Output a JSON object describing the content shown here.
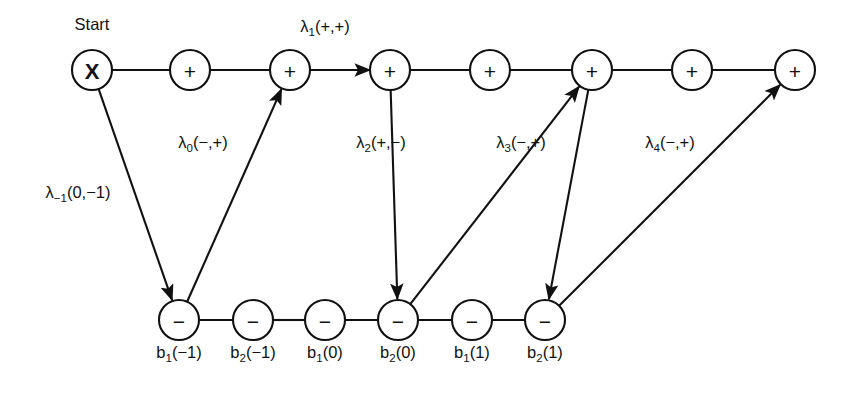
{
  "figure": {
    "background_color": "#ffffff",
    "stroke_color": "#111111",
    "start_label": "Start"
  },
  "top_row": {
    "y": 70,
    "radius": 20,
    "nodes": [
      {
        "id": "t0",
        "x": 92,
        "glyph": "X",
        "glyph_name": "x-glyph"
      },
      {
        "id": "t1",
        "x": 190,
        "glyph": "+",
        "glyph_name": "plus-glyph"
      },
      {
        "id": "t2",
        "x": 290,
        "glyph": "+",
        "glyph_name": "plus-glyph"
      },
      {
        "id": "t3",
        "x": 390,
        "glyph": "+",
        "glyph_name": "plus-glyph"
      },
      {
        "id": "t4",
        "x": 490,
        "glyph": "+",
        "glyph_name": "plus-glyph"
      },
      {
        "id": "t5",
        "x": 592,
        "glyph": "+",
        "glyph_name": "plus-glyph"
      },
      {
        "id": "t6",
        "x": 692,
        "glyph": "+",
        "glyph_name": "plus-glyph"
      },
      {
        "id": "t7",
        "x": 795,
        "glyph": "+",
        "glyph_name": "plus-glyph"
      }
    ]
  },
  "bottom_row": {
    "y": 320,
    "radius": 20,
    "label_y": 358,
    "nodes": [
      {
        "id": "b0",
        "x": 179,
        "glyph": "−",
        "glyph_name": "minus-glyph",
        "label_base": "b",
        "label_sub": "1",
        "label_arg": "(−1)"
      },
      {
        "id": "b1",
        "x": 253,
        "glyph": "−",
        "glyph_name": "minus-glyph",
        "label_base": "b",
        "label_sub": "2",
        "label_arg": "(−1)"
      },
      {
        "id": "b2",
        "x": 325,
        "glyph": "−",
        "glyph_name": "minus-glyph",
        "label_base": "b",
        "label_sub": "1",
        "label_arg": "(0)"
      },
      {
        "id": "b3",
        "x": 398,
        "glyph": "−",
        "glyph_name": "minus-glyph",
        "label_base": "b",
        "label_sub": "2",
        "label_arg": "(0)"
      },
      {
        "id": "b4",
        "x": 472,
        "glyph": "−",
        "glyph_name": "minus-glyph",
        "label_base": "b",
        "label_sub": "1",
        "label_arg": "(1)"
      },
      {
        "id": "b5",
        "x": 545,
        "glyph": "−",
        "glyph_name": "minus-glyph",
        "label_base": "b",
        "label_sub": "2",
        "label_arg": "(1)"
      }
    ]
  },
  "top_chain_edges": [
    {
      "from": "t0",
      "to": "t1",
      "arrow": false
    },
    {
      "from": "t1",
      "to": "t2",
      "arrow": false
    },
    {
      "from": "t2",
      "to": "t3",
      "arrow": true
    },
    {
      "from": "t3",
      "to": "t4",
      "arrow": false
    },
    {
      "from": "t4",
      "to": "t5",
      "arrow": false
    },
    {
      "from": "t5",
      "to": "t6",
      "arrow": false
    },
    {
      "from": "t6",
      "to": "t7",
      "arrow": false
    }
  ],
  "bottom_chain_edges": [
    {
      "from": "b0",
      "to": "b1",
      "arrow": false
    },
    {
      "from": "b1",
      "to": "b2",
      "arrow": false
    },
    {
      "from": "b2",
      "to": "b3",
      "arrow": false
    },
    {
      "from": "b3",
      "to": "b4",
      "arrow": false
    },
    {
      "from": "b4",
      "to": "b5",
      "arrow": false
    }
  ],
  "diagonal_edges": [
    {
      "id": "d-1",
      "from": "t0",
      "to": "b0",
      "direction": "down",
      "arrow": true
    },
    {
      "id": "d0",
      "from": "b0",
      "to": "t2",
      "direction": "up",
      "arrow": true
    },
    {
      "id": "d2",
      "from": "t3",
      "to": "b3",
      "direction": "down",
      "arrow": true
    },
    {
      "id": "d3",
      "from": "b3",
      "to": "t5",
      "direction": "up",
      "arrow": true
    },
    {
      "id": "d4",
      "from": "t5",
      "to": "b5",
      "direction": "down",
      "arrow": true
    },
    {
      "id": "d5",
      "from": "b5",
      "to": "t7",
      "direction": "up",
      "arrow": true
    }
  ],
  "lambda_labels": [
    {
      "id": "lam-m1",
      "base": "λ",
      "sub": "−1",
      "arg": "(0,−1)",
      "x": 78,
      "y": 198
    },
    {
      "id": "lam-0",
      "base": "λ",
      "sub": "0",
      "arg": "(−,+)",
      "x": 203,
      "y": 148
    },
    {
      "id": "lam-1",
      "base": "λ",
      "sub": "1",
      "arg": "(+,+)",
      "x": 325,
      "y": 32
    },
    {
      "id": "lam-2",
      "base": "λ",
      "sub": "2",
      "arg": "(+,−)",
      "x": 381,
      "y": 148
    },
    {
      "id": "lam-3",
      "base": "λ",
      "sub": "3",
      "arg": "(−,+)",
      "x": 521,
      "y": 148
    },
    {
      "id": "lam-4",
      "base": "λ",
      "sub": "4",
      "arg": "(−,+)",
      "x": 670,
      "y": 148
    }
  ]
}
